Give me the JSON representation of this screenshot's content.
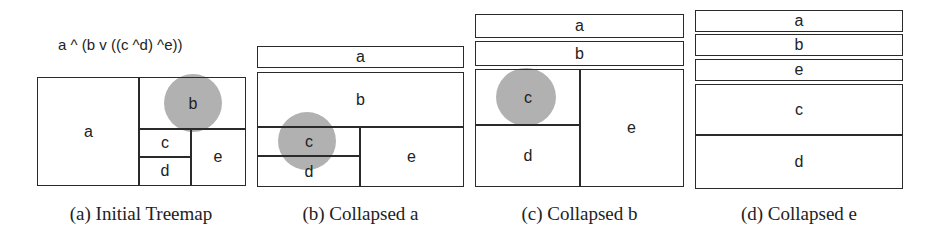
{
  "formula": "a ^ (b v ((c ^d) ^e))",
  "highlight_color": "#a8a8a8",
  "panels": [
    {
      "caption": "(a) Initial Treemap",
      "labels": {
        "a": "a",
        "b": "b",
        "c": "c",
        "d": "d",
        "e": "e"
      },
      "highlighted": "b"
    },
    {
      "caption": "(b) Collapsed a",
      "labels": {
        "a": "a",
        "b": "b",
        "c": "c",
        "d": "d",
        "e": "e"
      },
      "highlighted": "c"
    },
    {
      "caption": "(c) Collapsed b",
      "labels": {
        "a": "a",
        "b": "b",
        "c": "c",
        "d": "d",
        "e": "e"
      },
      "highlighted": "c"
    },
    {
      "caption": "(d) Collapsed e",
      "labels": {
        "a": "a",
        "b": "b",
        "c": "c",
        "d": "d",
        "e": "e"
      },
      "highlighted": null
    }
  ]
}
